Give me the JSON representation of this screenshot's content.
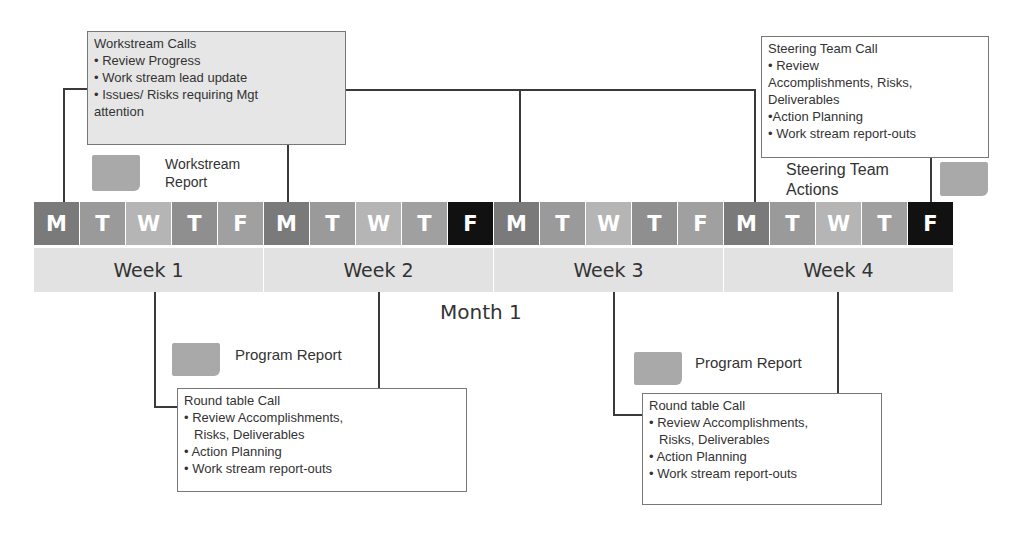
{
  "workstream_calls": {
    "title": "Workstream Calls",
    "items": [
      "• Review Progress",
      "• Work stream lead update",
      "• Issues/ Risks requiring Mgt",
      "attention"
    ]
  },
  "workstream_report": {
    "line1": "Workstream",
    "line2": "Report"
  },
  "steering_call": {
    "title": "Steering Team Call",
    "items": [
      "• Review",
      "Accomplishments, Risks,",
      "Deliverables",
      "•Action Planning",
      "• Work stream report-outs"
    ]
  },
  "steering_actions": {
    "line1": "Steering Team",
    "line2": "Actions"
  },
  "days": [
    {
      "label": "M",
      "color": "#7a7a7a"
    },
    {
      "label": "T",
      "color": "#9a9a9a"
    },
    {
      "label": "W",
      "color": "#b5b5b5"
    },
    {
      "label": "T",
      "color": "#8f8f8f"
    },
    {
      "label": "F",
      "color": "#a0a0a0"
    },
    {
      "label": "M",
      "color": "#7a7a7a"
    },
    {
      "label": "T",
      "color": "#9a9a9a"
    },
    {
      "label": "W",
      "color": "#b5b5b5"
    },
    {
      "label": "T",
      "color": "#a0a0a0"
    },
    {
      "label": "F",
      "color": "#111111"
    },
    {
      "label": "M",
      "color": "#7a7a7a"
    },
    {
      "label": "T",
      "color": "#9a9a9a"
    },
    {
      "label": "W",
      "color": "#b5b5b5"
    },
    {
      "label": "T",
      "color": "#8f8f8f"
    },
    {
      "label": "F",
      "color": "#a0a0a0"
    },
    {
      "label": "M",
      "color": "#7a7a7a"
    },
    {
      "label": "T",
      "color": "#9a9a9a"
    },
    {
      "label": "W",
      "color": "#b5b5b5"
    },
    {
      "label": "T",
      "color": "#a0a0a0"
    },
    {
      "label": "F",
      "color": "#111111"
    }
  ],
  "weeks": [
    "Week 1",
    "Week 2",
    "Week 3",
    "Week 4"
  ],
  "month": "Month 1",
  "program_report_1": "Program Report",
  "program_report_2": "Program Report",
  "roundtable_1": {
    "title": "Round table Call",
    "items": [
      "•  Review Accomplishments,",
      "Risks, Deliverables",
      "• Action Planning",
      "•  Work stream report-outs"
    ]
  },
  "roundtable_2": {
    "title": "Round table Call",
    "items": [
      "•  Review Accomplishments,",
      "Risks, Deliverables",
      "• Action Planning",
      "•  Work stream report-outs"
    ]
  }
}
